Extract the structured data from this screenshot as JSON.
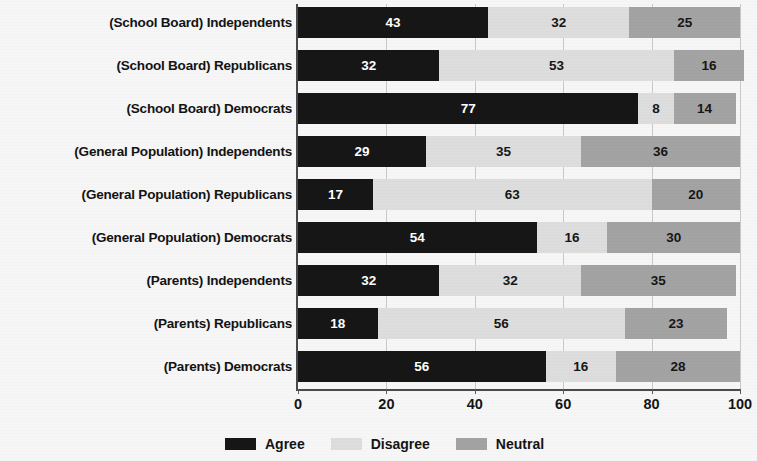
{
  "chart_data": {
    "type": "bar",
    "orientation": "horizontal",
    "stacked": true,
    "title": "",
    "subtitle": "",
    "xlabel": "",
    "ylabel": "",
    "xlim": [
      0,
      100
    ],
    "xticks": [
      0,
      20,
      40,
      60,
      80,
      100
    ],
    "xtick_labels": [
      "0",
      "20",
      "40",
      "60",
      "80",
      "100"
    ],
    "grid": true,
    "grid_axis": "x",
    "legend_position": "bottom",
    "categories": [
      "(School Board) Independents",
      "(School Board) Republicans",
      "(School Board) Democrats",
      "(General Population) Independents",
      "(General Population) Republicans",
      "(General Population) Democrats",
      "(Parents) Independents",
      "(Parents) Republicans",
      "(Parents) Democrats"
    ],
    "series": [
      {
        "name": "Agree",
        "color": "#161616",
        "values": [
          43,
          32,
          77,
          29,
          17,
          54,
          32,
          18,
          56
        ]
      },
      {
        "name": "Disagree",
        "color": "#dddddd",
        "values": [
          32,
          53,
          8,
          35,
          63,
          16,
          32,
          56,
          16
        ]
      },
      {
        "name": "Neutral",
        "color": "#a3a3a3",
        "values": [
          25,
          16,
          14,
          36,
          20,
          30,
          35,
          23,
          28
        ]
      }
    ],
    "legend": [
      "Agree",
      "Disagree",
      "Neutral"
    ]
  },
  "colors": {
    "background": "#f6f6f6",
    "agree": "#161616",
    "disagree": "#dddddd",
    "neutral": "#a3a3a3",
    "axis": "#4a4a4a",
    "gridline": "#c9c9c9",
    "text": "#141414"
  }
}
